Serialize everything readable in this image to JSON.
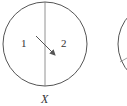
{
  "diagram": {
    "circle_x": {
      "region_left_label": "1",
      "region_right_label": "2",
      "caption": "X"
    },
    "colors": {
      "stroke": "#555555",
      "text": "#333333"
    }
  }
}
